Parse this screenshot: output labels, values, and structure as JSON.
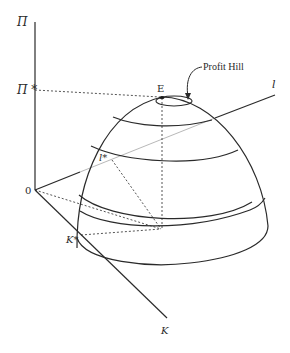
{
  "diagram": {
    "title": "Profit Hill",
    "axes": {
      "vertical": {
        "label": "Π",
        "marker_label": "Π *"
      },
      "depth": {
        "label": "K",
        "marker_label": "K*"
      },
      "right": {
        "label": "l",
        "marker_label": "l*"
      },
      "origin_label": "0"
    },
    "peak_label": "E",
    "annotation": "Profit Hill",
    "colors": {
      "line": "#2a2a2a",
      "thin_line": "#9a9a9a",
      "background": "#ffffff"
    }
  }
}
